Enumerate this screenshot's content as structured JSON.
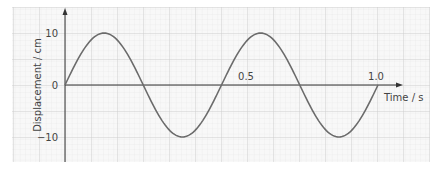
{
  "chart_data": {
    "type": "line",
    "title": "",
    "xlabel": "Time / s",
    "ylabel": "Displacement / cm",
    "x_ticks": [
      "0.5",
      "1.0"
    ],
    "y_ticks": [
      "10",
      "0",
      "−10"
    ],
    "xlim": [
      0,
      1.0
    ],
    "ylim": [
      -10,
      10
    ],
    "grid": true,
    "series": [
      {
        "name": "displacement",
        "function": "10*sin(2*pi*t/0.5)",
        "amplitude_cm": 10,
        "period_s": 0.5,
        "x": [
          0,
          0.125,
          0.25,
          0.375,
          0.5,
          0.625,
          0.75,
          0.875,
          1.0
        ],
        "values": [
          0,
          10,
          0,
          -10,
          0,
          10,
          0,
          -10,
          0
        ]
      }
    ]
  },
  "labels": {
    "y_axis": "Displacement / cm",
    "x_axis": "Time / s",
    "tick_10": "10",
    "tick_0": "0",
    "tick_neg10": "−10",
    "tick_05": "0.5",
    "tick_10s": "1.0"
  },
  "colors": {
    "curve": "#6b6b6b",
    "axis": "#333333",
    "grid_major": "#cfcfcf",
    "grid_minor": "#ececec",
    "background": "#f7f7f7"
  }
}
